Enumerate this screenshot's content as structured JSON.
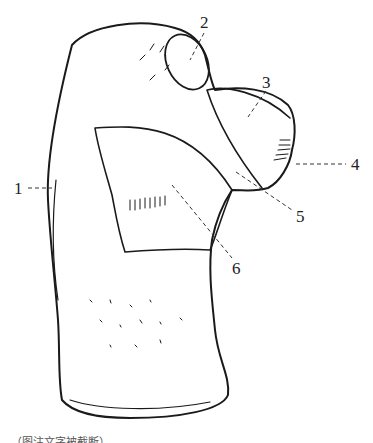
{
  "figure": {
    "type": "anatomical line drawing",
    "stroke_color": "#1a1a1a",
    "background": "#ffffff",
    "labels": [
      {
        "id": "1",
        "text": "1"
      },
      {
        "id": "2",
        "text": "2"
      },
      {
        "id": "3",
        "text": "3"
      },
      {
        "id": "4",
        "text": "4"
      },
      {
        "id": "5",
        "text": "5"
      },
      {
        "id": "6",
        "text": "6"
      }
    ],
    "caption": "…（图注文字被截断）…"
  }
}
